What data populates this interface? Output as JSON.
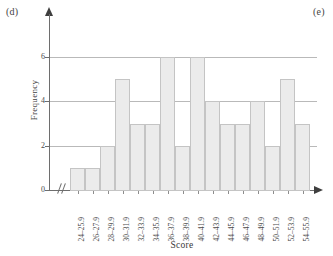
{
  "panels": {
    "left_tag": "(d)",
    "right_tag": "(e)"
  },
  "chart_data": {
    "type": "bar",
    "title": "",
    "xlabel": "Score",
    "ylabel": "Frequency",
    "categories": [
      "24–25.9",
      "26–27.9",
      "28–29.9",
      "30–31.9",
      "32–33.9",
      "34–35.9",
      "36–37.9",
      "38–39.9",
      "40–41.9",
      "42–43.9",
      "44–45.9",
      "46–47.9",
      "48–49.9",
      "50–51.9",
      "52–53.9",
      "54–55.9"
    ],
    "values": [
      1,
      1,
      2,
      5,
      3,
      3,
      6,
      2,
      6,
      4,
      3,
      3,
      4,
      2,
      5,
      3
    ],
    "ylim": [
      0,
      8
    ],
    "ytick_labels": [
      "0",
      "2",
      "4",
      "6"
    ],
    "ytick_values": [
      0,
      2,
      4,
      6
    ],
    "gridlines": [
      2,
      4,
      6
    ],
    "grid": true,
    "legend": "none",
    "axis_break": "//",
    "bar_fill": "#ebebeb",
    "bar_stroke": "#c4c4c4",
    "grid_color": "#b9b9b9",
    "axis_color": "#6e6e6e"
  }
}
